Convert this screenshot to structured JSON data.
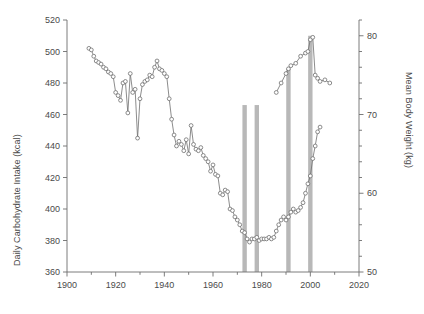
{
  "chart_data": {
    "type": "line",
    "title": "",
    "subtitle": "",
    "xlabel": "",
    "ylabel": "Daily Carbohydrate Intake (kcal)",
    "ylabel_right": "Mean Body Weight (kg)",
    "xlim": [
      1900,
      2020
    ],
    "ylim": [
      360,
      520
    ],
    "ylim_right": [
      50,
      82
    ],
    "grid": false,
    "legend": "none",
    "x_ticks": [
      1900,
      1920,
      1940,
      1960,
      1980,
      2000,
      2020
    ],
    "x_tick_labels": [
      "1900",
      "1920",
      "1940",
      "1960",
      "1980",
      "2000",
      "2020"
    ],
    "x_minor_ticks": [
      1910,
      1930,
      1950,
      1970,
      1990,
      2010
    ],
    "y_ticks": [
      360,
      380,
      400,
      420,
      440,
      460,
      480,
      500,
      520
    ],
    "y_tick_labels": [
      "360",
      "380",
      "400",
      "420",
      "440",
      "460",
      "480",
      "500",
      "520"
    ],
    "y_right_ticks": [
      50,
      52,
      54,
      56,
      58,
      60,
      62,
      64,
      66,
      68,
      70,
      72,
      74,
      76,
      78,
      80,
      82
    ],
    "y_right_labeled_ticks": [
      50,
      60,
      70,
      80
    ],
    "y_right_tick_labels": [
      "50",
      "60",
      "70",
      "80"
    ],
    "series": [
      {
        "name": "Daily Carbohydrate Intake (kcal)",
        "axis": "left",
        "marker": "open-circle",
        "color": "#6e6e6e",
        "x": [
          1909,
          1910,
          1911,
          1912,
          1913,
          1914,
          1915,
          1916,
          1917,
          1918,
          1919,
          1920,
          1921,
          1922,
          1923,
          1924,
          1925,
          1926,
          1927,
          1928,
          1929,
          1930,
          1931,
          1932,
          1933,
          1934,
          1935,
          1936,
          1937,
          1938,
          1939,
          1940,
          1941,
          1942,
          1943,
          1944,
          1945,
          1946,
          1947,
          1948,
          1949,
          1950,
          1951,
          1952,
          1953,
          1954,
          1955,
          1956,
          1957,
          1958,
          1959,
          1960,
          1961,
          1962,
          1963,
          1964,
          1965,
          1966,
          1967,
          1968,
          1969,
          1970,
          1971,
          1972,
          1973,
          1974,
          1975,
          1976,
          1977,
          1978,
          1979,
          1980,
          1981,
          1982,
          1983,
          1984,
          1985,
          1986,
          1987,
          1988,
          1989,
          1990,
          1991,
          1992,
          1993,
          1994,
          1995,
          1996,
          1997,
          1998,
          1999,
          2000,
          2001,
          2002,
          2003,
          2004
        ],
        "y": [
          502,
          501,
          497,
          494,
          493,
          492,
          490,
          489,
          487,
          486,
          484,
          474,
          472,
          469,
          480,
          481,
          461,
          486,
          474,
          476,
          445,
          470,
          479,
          481,
          482,
          485,
          484,
          490,
          494,
          489,
          488,
          486,
          484,
          470,
          457,
          447,
          440,
          443,
          441,
          437,
          444,
          435,
          453,
          441,
          438,
          437,
          439,
          434,
          432,
          430,
          424,
          428,
          422,
          421,
          410,
          409,
          412,
          411,
          400,
          399,
          395,
          393,
          390,
          386,
          385,
          381,
          379,
          381,
          381,
          382,
          380,
          381,
          381,
          381,
          382,
          381,
          382,
          386,
          390,
          393,
          395,
          393,
          395,
          398,
          400,
          398,
          399,
          401,
          404,
          410,
          416,
          421,
          432,
          440,
          449,
          452
        ]
      },
      {
        "name": "Mean Body Weight (kg)",
        "axis": "right",
        "marker": "open-circle",
        "color": "#6e6e6e",
        "x": [
          1986,
          1988,
          1990,
          1991,
          1992,
          1994,
          1996,
          1998,
          1999,
          2000,
          2001,
          2002,
          2003,
          2004,
          2006,
          2008
        ],
        "y": [
          72.8,
          74.0,
          75.2,
          75.8,
          76.2,
          76.5,
          77.4,
          77.8,
          78.0,
          79.5,
          79.8,
          75.0,
          74.6,
          74.2,
          74.4,
          74.0
        ]
      }
    ],
    "vertical_bars": [
      {
        "x": 1973,
        "top_value": 466,
        "label": "1973"
      },
      {
        "x": 1978,
        "top_value": 466,
        "label": "1978"
      },
      {
        "x": 1991,
        "top_value": 489,
        "label": "1991"
      },
      {
        "x": 2000,
        "top_value": 510,
        "label": "2000"
      }
    ],
    "vertical_bar_color": "#b8b8b8",
    "axis_color": "#6e6e6e",
    "background": "#ffffff"
  }
}
